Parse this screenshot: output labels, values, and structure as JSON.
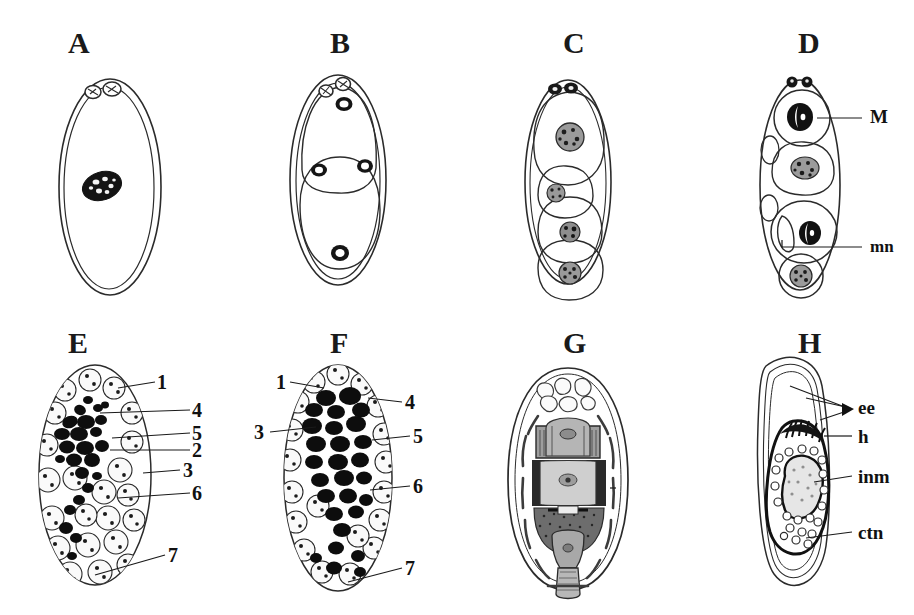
{
  "figure": {
    "background_color": "#ffffff",
    "ink_color": "#1a1a1a",
    "panel_count": 8
  },
  "panels": [
    {
      "id": "A",
      "letter": "A",
      "description": "Uncleaved egg with two polar bodies at animal pole and a single dark zygote nucleus",
      "labels": []
    },
    {
      "id": "B",
      "letter": "B",
      "description": "Two-cell stage with overlapping blastomeres and polar bodies",
      "labels": []
    },
    {
      "id": "C",
      "letter": "C",
      "description": "Four-cell stage, blastomeres stacked along the egg axis, each with a stippled nucleus",
      "labels": []
    },
    {
      "id": "D",
      "letter": "D",
      "description": "Cleavage stage showing a macromere with dark nucleus and a micromere",
      "labels": [
        {
          "text": "M",
          "meaning": "macromere nucleus"
        },
        {
          "text": "mn",
          "meaning": "micronucleus"
        }
      ]
    },
    {
      "id": "E",
      "letter": "E",
      "description": "Morula-like stage with numbered cell lineages 1 to 7",
      "labels": [
        {
          "text": "1"
        },
        {
          "text": "4"
        },
        {
          "text": "5"
        },
        {
          "text": "2"
        },
        {
          "text": "3"
        },
        {
          "text": "6"
        },
        {
          "text": "7"
        }
      ]
    },
    {
      "id": "F",
      "letter": "F",
      "description": "Advanced morula with dense chromatin masses, numbered cell lineages 1 to 7",
      "labels": [
        {
          "text": "1"
        },
        {
          "text": "3"
        },
        {
          "text": "4"
        },
        {
          "text": "5"
        },
        {
          "text": "6"
        },
        {
          "text": "7"
        }
      ]
    },
    {
      "id": "G",
      "letter": "G",
      "description": "Late embryo with differentiated body regions inside the shell",
      "labels": []
    },
    {
      "id": "H",
      "letter": "H",
      "description": "Fully formed infective larva within egg envelopes",
      "labels": [
        {
          "text": "ee",
          "meaning": "egg envelopes"
        },
        {
          "text": "h",
          "meaning": "hooks"
        },
        {
          "text": "inm",
          "meaning": "inner membrane"
        },
        {
          "text": "ctn",
          "meaning": "central nuclei"
        }
      ]
    }
  ]
}
